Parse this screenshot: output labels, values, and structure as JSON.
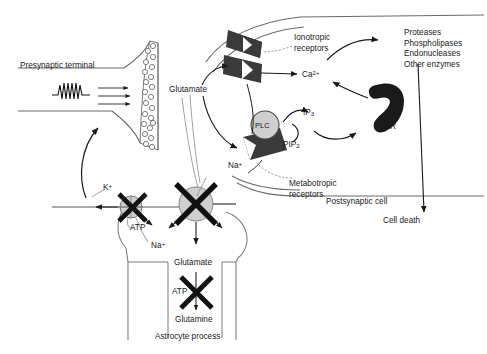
{
  "figure": {
    "width": 487,
    "height": 354,
    "background": "#ffffff",
    "ink": "#1a1a1a",
    "fill_dark": "#3a3a3a",
    "fill_gray": "#cfcfcf"
  },
  "labels": {
    "presynaptic_terminal": "Presynaptic terminal",
    "glutamate_cleft": "Glutamate",
    "ionotropic_receptors": "Ionotropic\nreceptors",
    "metabotropic_receptors": "Metabotropic\nreceptors",
    "calcium": "Ca",
    "calcium_charge": "2+",
    "ip3": "IP",
    "ip3_sub": "3",
    "pip2": "PIP",
    "pip2_sub": "2",
    "plc": "PLC",
    "ser": "SER",
    "enzymes": "Proteases\nPhospholipases\nEndonucleases\nOther enzymes",
    "postsynaptic_cell": "Postsynaptic cell",
    "cell_death": "Cell death",
    "sodium_cleft": "Na",
    "sodium_cleft_charge": "+",
    "potassium": "K",
    "potassium_charge": "+",
    "atp_pump": "ATP",
    "sodium_pump": "Na",
    "sodium_pump_charge": "+",
    "glutamate_astro": "Glutamate",
    "atp_synthase": "ATP",
    "glutamine": "Glutamine",
    "astrocyte_process": "Astrocyte process"
  },
  "enzyme_list": [
    "Proteases",
    "Phospholipases",
    "Endonucleases",
    "Other enzymes"
  ],
  "receptor_labels": {
    "ionotropic_line1": "Ionotropic",
    "ionotropic_line2": "receptors",
    "metabotropic_line1": "Metabotropic",
    "metabotropic_line2": "receptors"
  }
}
